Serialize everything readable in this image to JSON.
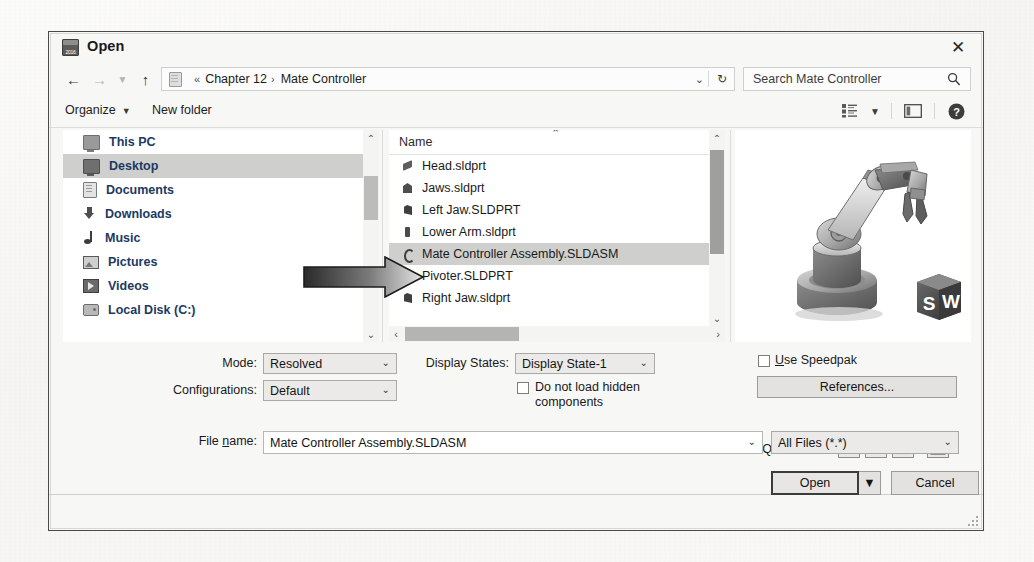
{
  "window": {
    "title": "Open",
    "icon": "solidworks-2016-icon",
    "icon_year": "2016",
    "close_label": "✕"
  },
  "address_bar": {
    "back_icon": "arrow-left-icon",
    "forward_icon": "arrow-right-icon",
    "recent_icon": "chevron-down-icon",
    "up_icon": "arrow-up-icon",
    "folder_icon": "folder-icon",
    "crumb_prefix": "«",
    "crumbs": [
      "Chapter 12",
      "Mate Controller"
    ],
    "separator": "›",
    "dropdown_icon": "chevron-down-icon",
    "refresh_icon": "refresh-icon",
    "refresh_glyph": "↻"
  },
  "search": {
    "value": "Search Mate Controller",
    "icon": "search-icon"
  },
  "command_bar": {
    "organize_label": "Organize",
    "organize_caret": "▼",
    "new_folder_label": "New folder",
    "view_icon": "view-list-icon",
    "view_caret": "▼",
    "preview_pane_icon": "preview-pane-icon",
    "help_icon": "help-icon",
    "help_glyph": "?"
  },
  "nav_pane": {
    "items": [
      {
        "label": "This PC",
        "icon": "this-pc-icon",
        "selected": false
      },
      {
        "label": "Desktop",
        "icon": "desktop-icon",
        "selected": true
      },
      {
        "label": "Documents",
        "icon": "documents-icon",
        "selected": false
      },
      {
        "label": "Downloads",
        "icon": "downloads-icon",
        "selected": false
      },
      {
        "label": "Music",
        "icon": "music-icon",
        "selected": false
      },
      {
        "label": "Pictures",
        "icon": "pictures-icon",
        "selected": false
      },
      {
        "label": "Videos",
        "icon": "videos-icon",
        "selected": false
      },
      {
        "label": "Local Disk (C:)",
        "icon": "local-disk-icon",
        "selected": false
      }
    ],
    "scroll_up": "⌃",
    "scroll_down": "⌄"
  },
  "file_list": {
    "column_header": "Name",
    "sort_indicator": "⌃",
    "rows": [
      {
        "name": "Head.sldprt",
        "icon": "sw-part-icon",
        "selected": false
      },
      {
        "name": "Jaws.sldprt",
        "icon": "sw-part-icon",
        "selected": false
      },
      {
        "name": "Left Jaw.SLDPRT",
        "icon": "sw-part-icon",
        "selected": false
      },
      {
        "name": "Lower Arm.sldprt",
        "icon": "sw-part-icon",
        "selected": false
      },
      {
        "name": "Mate Controller Assembly.SLDASM",
        "icon": "sw-assembly-icon",
        "selected": true
      },
      {
        "name": "Pivoter.SLDPRT",
        "icon": "sw-part-icon",
        "selected": false
      },
      {
        "name": "Right Jaw.sldprt",
        "icon": "sw-part-icon",
        "selected": false
      }
    ],
    "scroll_up": "⌃",
    "scroll_down": "⌄",
    "scroll_left": "‹",
    "scroll_right": "›"
  },
  "preview": {
    "alt": "robot-arm-assembly-thumbnail",
    "badge": "solidworks-cube-badge",
    "badge_letters": [
      "S",
      "W"
    ]
  },
  "options": {
    "mode_label": "Mode:",
    "mode_value": "Resolved",
    "configurations_label": "Configurations:",
    "configurations_value": "Default",
    "display_states_label": "Display States:",
    "display_states_value": "Display State-1",
    "do_not_load_checked": false,
    "do_not_load_line1": "Do not load hidden",
    "do_not_load_line2": "components",
    "use_speedpak_checked": false,
    "use_speedpak_label_u": "U",
    "use_speedpak_label_rest": "se Speedpak",
    "references_button": "References...",
    "quick_filter_label": "Quick Filter:",
    "quick_filter_icons": [
      "filter-parts-icon",
      "filter-assemblies-icon",
      "filter-drawings-icon",
      "filter-top-level-assemblies-icon"
    ],
    "caret": "⌄"
  },
  "footer": {
    "file_name_label_pre": "File ",
    "file_name_label_u": "n",
    "file_name_label_post": "ame:",
    "file_name_value": "Mate Controller Assembly.SLDASM",
    "file_name_caret": "⌄",
    "file_type_value": "All Files (*.*)",
    "file_type_caret": "⌄",
    "open_button": "Open",
    "open_split_caret": "▼",
    "cancel_button": "Cancel",
    "resize_grip": "resize-grip-icon"
  },
  "annotation": {
    "arrow": "callout-arrow-icon"
  }
}
